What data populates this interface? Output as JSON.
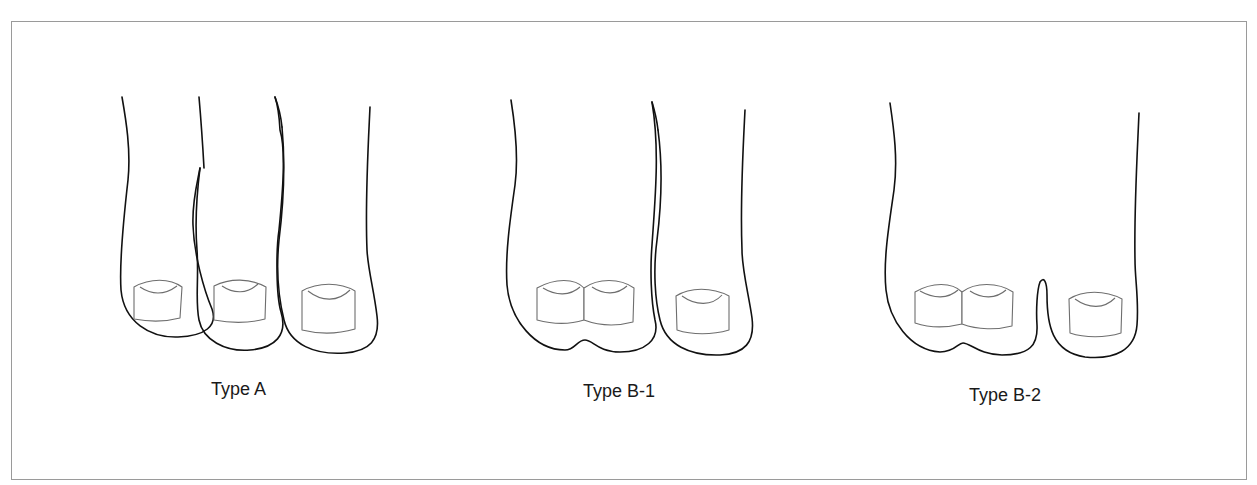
{
  "figure": {
    "panels": [
      {
        "id": "type-a",
        "label": "Type A",
        "description": "Three separate toes, each with its own nail"
      },
      {
        "id": "type-b1",
        "label": "Type B-1",
        "description": "Two fused toes sharing one outline with two adjacent nails, plus one separate toe"
      },
      {
        "id": "type-b2",
        "label": "Type B-2",
        "description": "Fused two-nail toe plus adjacent toe joined with a narrow cleft"
      }
    ]
  },
  "colors": {
    "outline": "#111111",
    "nail": "#6e6e6e",
    "frame": "#9a9a9a",
    "background": "#ffffff"
  }
}
